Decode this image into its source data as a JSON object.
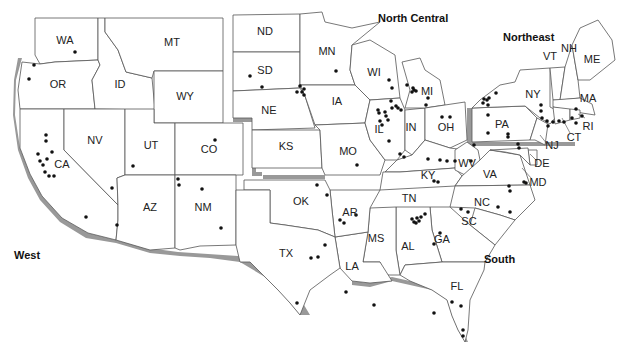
{
  "map": {
    "title": "United States regional map with site locations",
    "regions": [
      {
        "label": "West",
        "x": 14,
        "y": 259
      },
      {
        "label": "North Central",
        "x": 378,
        "y": 22
      },
      {
        "label": "Northeast",
        "x": 503,
        "y": 41
      },
      {
        "label": "South",
        "x": 484,
        "y": 263
      }
    ],
    "states": [
      {
        "abbr": "WA",
        "x": 65,
        "y": 41
      },
      {
        "abbr": "OR",
        "x": 58,
        "y": 85
      },
      {
        "abbr": "ID",
        "x": 120,
        "y": 85
      },
      {
        "abbr": "MT",
        "x": 172,
        "y": 43
      },
      {
        "abbr": "WY",
        "x": 185,
        "y": 97
      },
      {
        "abbr": "CA",
        "x": 62,
        "y": 165
      },
      {
        "abbr": "NV",
        "x": 95,
        "y": 141
      },
      {
        "abbr": "UT",
        "x": 151,
        "y": 146
      },
      {
        "abbr": "CO",
        "x": 209,
        "y": 150
      },
      {
        "abbr": "AZ",
        "x": 150,
        "y": 208
      },
      {
        "abbr": "NM",
        "x": 203,
        "y": 208
      },
      {
        "abbr": "ND",
        "x": 265,
        "y": 32
      },
      {
        "abbr": "SD",
        "x": 265,
        "y": 71
      },
      {
        "abbr": "NE",
        "x": 269,
        "y": 111
      },
      {
        "abbr": "KS",
        "x": 286,
        "y": 147
      },
      {
        "abbr": "MN",
        "x": 327,
        "y": 52
      },
      {
        "abbr": "IA",
        "x": 337,
        "y": 102
      },
      {
        "abbr": "MO",
        "x": 348,
        "y": 152
      },
      {
        "abbr": "WI",
        "x": 374,
        "y": 73
      },
      {
        "abbr": "IL",
        "x": 379,
        "y": 130
      },
      {
        "abbr": "MI",
        "x": 427,
        "y": 92
      },
      {
        "abbr": "IN",
        "x": 411,
        "y": 128
      },
      {
        "abbr": "OH",
        "x": 446,
        "y": 128
      },
      {
        "abbr": "KY",
        "x": 428,
        "y": 176
      },
      {
        "abbr": "TN",
        "x": 409,
        "y": 199
      },
      {
        "abbr": "WV",
        "x": 467,
        "y": 164
      },
      {
        "abbr": "VA",
        "x": 490,
        "y": 175
      },
      {
        "abbr": "NC",
        "x": 482,
        "y": 203
      },
      {
        "abbr": "SC",
        "x": 469,
        "y": 222
      },
      {
        "abbr": "GA",
        "x": 442,
        "y": 240
      },
      {
        "abbr": "AL",
        "x": 408,
        "y": 247
      },
      {
        "abbr": "MS",
        "x": 376,
        "y": 239
      },
      {
        "abbr": "LA",
        "x": 352,
        "y": 267
      },
      {
        "abbr": "AR",
        "x": 350,
        "y": 213
      },
      {
        "abbr": "OK",
        "x": 301,
        "y": 202
      },
      {
        "abbr": "TX",
        "x": 286,
        "y": 254
      },
      {
        "abbr": "FL",
        "x": 457,
        "y": 287
      },
      {
        "abbr": "PA",
        "x": 502,
        "y": 125
      },
      {
        "abbr": "NY",
        "x": 533,
        "y": 95
      },
      {
        "abbr": "VT",
        "x": 550,
        "y": 57
      },
      {
        "abbr": "NH",
        "x": 569,
        "y": 49
      },
      {
        "abbr": "ME",
        "x": 592,
        "y": 60
      },
      {
        "abbr": "MA",
        "x": 588,
        "y": 99
      },
      {
        "abbr": "RI",
        "x": 588,
        "y": 127
      },
      {
        "abbr": "CT",
        "x": 574,
        "y": 138
      },
      {
        "abbr": "NJ",
        "x": 552,
        "y": 146
      },
      {
        "abbr": "DE",
        "x": 542,
        "y": 164
      },
      {
        "abbr": "MD",
        "x": 538,
        "y": 183
      }
    ],
    "site_dots": [
      [
        75,
        52
      ],
      [
        34,
        65
      ],
      [
        29,
        79
      ],
      [
        46,
        135
      ],
      [
        46,
        141
      ],
      [
        52,
        152
      ],
      [
        47,
        159
      ],
      [
        38,
        154
      ],
      [
        40,
        161
      ],
      [
        43,
        165
      ],
      [
        45,
        172
      ],
      [
        49,
        176
      ],
      [
        54,
        176
      ],
      [
        112,
        188
      ],
      [
        133,
        166
      ],
      [
        86,
        217
      ],
      [
        117,
        225
      ],
      [
        178,
        179
      ],
      [
        179,
        185
      ],
      [
        202,
        189
      ],
      [
        221,
        228
      ],
      [
        215,
        140
      ],
      [
        250,
        76
      ],
      [
        262,
        87
      ],
      [
        300,
        86
      ],
      [
        297,
        92
      ],
      [
        302,
        92
      ],
      [
        304,
        89
      ],
      [
        304,
        95
      ],
      [
        336,
        71
      ],
      [
        297,
        303
      ],
      [
        374,
        305
      ],
      [
        389,
        80
      ],
      [
        392,
        88
      ],
      [
        391,
        101
      ],
      [
        392,
        108
      ],
      [
        396,
        106
      ],
      [
        378,
        110
      ],
      [
        379,
        113
      ],
      [
        386,
        116
      ],
      [
        388,
        120
      ],
      [
        380,
        121
      ],
      [
        382,
        125
      ],
      [
        385,
        112
      ],
      [
        389,
        141
      ],
      [
        398,
        108
      ],
      [
        401,
        110
      ],
      [
        407,
        85
      ],
      [
        413,
        88
      ],
      [
        414,
        90
      ],
      [
        416,
        91
      ],
      [
        412,
        92
      ],
      [
        428,
        98
      ],
      [
        426,
        105
      ],
      [
        442,
        117
      ],
      [
        450,
        117
      ],
      [
        400,
        154
      ],
      [
        404,
        157
      ],
      [
        428,
        159
      ],
      [
        440,
        160
      ],
      [
        447,
        161
      ],
      [
        455,
        161
      ],
      [
        483,
        103
      ],
      [
        484,
        99
      ],
      [
        489,
        98
      ],
      [
        487,
        100
      ],
      [
        496,
        93
      ],
      [
        488,
        105
      ],
      [
        488,
        115
      ],
      [
        488,
        133
      ],
      [
        508,
        134
      ],
      [
        508,
        137
      ],
      [
        434,
        181
      ],
      [
        438,
        182
      ],
      [
        419,
        221
      ],
      [
        421,
        217
      ],
      [
        425,
        214
      ],
      [
        412,
        219
      ],
      [
        414,
        222
      ],
      [
        416,
        223
      ],
      [
        417,
        218
      ],
      [
        434,
        244
      ],
      [
        440,
        233
      ],
      [
        468,
        212
      ],
      [
        461,
        209
      ],
      [
        509,
        186
      ],
      [
        510,
        191
      ],
      [
        524,
        182
      ],
      [
        526,
        183
      ],
      [
        518,
        144
      ],
      [
        519,
        148
      ],
      [
        541,
        105
      ],
      [
        541,
        111
      ],
      [
        542,
        118
      ],
      [
        547,
        121
      ],
      [
        548,
        126
      ],
      [
        553,
        122
      ],
      [
        559,
        121
      ],
      [
        564,
        122
      ],
      [
        576,
        123
      ],
      [
        572,
        118
      ],
      [
        576,
        109
      ],
      [
        582,
        116
      ],
      [
        317,
        185
      ],
      [
        327,
        195
      ],
      [
        340,
        220
      ],
      [
        344,
        223
      ],
      [
        325,
        245
      ],
      [
        311,
        258
      ],
      [
        318,
        257
      ],
      [
        357,
        165
      ],
      [
        346,
        292
      ],
      [
        356,
        215
      ],
      [
        434,
        313
      ],
      [
        452,
        302
      ],
      [
        461,
        306
      ],
      [
        463,
        330
      ],
      [
        463,
        336
      ],
      [
        474,
        145
      ],
      [
        471,
        161
      ],
      [
        498,
        207
      ],
      [
        510,
        212
      ]
    ]
  }
}
